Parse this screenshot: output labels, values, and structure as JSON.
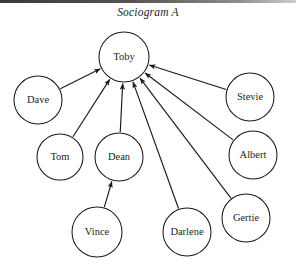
{
  "figure": {
    "title": "Sociogram A",
    "top_rule_color": "#3a3a38",
    "background_color": "#ffffff",
    "stroke_color": "#1c1a18",
    "text_color": "#241f1c",
    "width": 296,
    "height": 266
  },
  "chart_data": {
    "type": "diagram",
    "diagram_kind": "sociogram",
    "title": "Sociogram A",
    "directed": true,
    "node_count": 9,
    "edge_count": 8,
    "nodes": [
      {
        "id": "toby",
        "label": "Toby",
        "cx": 124,
        "cy": 57,
        "r": 25
      },
      {
        "id": "dave",
        "label": "Dave",
        "cx": 38,
        "cy": 100,
        "r": 24
      },
      {
        "id": "stevie",
        "label": "Stevie",
        "cx": 250,
        "cy": 97,
        "r": 24
      },
      {
        "id": "tom",
        "label": "Tom",
        "cx": 60,
        "cy": 157,
        "r": 23
      },
      {
        "id": "dean",
        "label": "Dean",
        "cx": 119,
        "cy": 157,
        "r": 24
      },
      {
        "id": "albert",
        "label": "Albert",
        "cx": 253,
        "cy": 155,
        "r": 24
      },
      {
        "id": "gertie",
        "label": "Gertie",
        "cx": 246,
        "cy": 218,
        "r": 24
      },
      {
        "id": "darlene",
        "label": "Darlene",
        "cx": 187,
        "cy": 232,
        "r": 24
      },
      {
        "id": "vince",
        "label": "Vince",
        "cx": 97,
        "cy": 232,
        "r": 25
      }
    ],
    "edges": [
      {
        "from": "dave",
        "to": "toby",
        "arrow": "to"
      },
      {
        "from": "tom",
        "to": "toby",
        "arrow": "to"
      },
      {
        "from": "dean",
        "to": "toby",
        "arrow": "to"
      },
      {
        "from": "darlene",
        "to": "toby",
        "arrow": "to"
      },
      {
        "from": "gertie",
        "to": "toby",
        "arrow": "to"
      },
      {
        "from": "albert",
        "to": "toby",
        "arrow": "to"
      },
      {
        "from": "stevie",
        "to": "toby",
        "arrow": "to"
      },
      {
        "from": "vince",
        "to": "dean",
        "arrow": "to"
      }
    ]
  }
}
